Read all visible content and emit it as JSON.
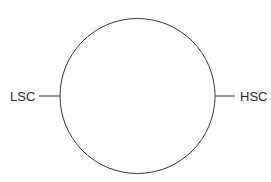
{
  "diagram": {
    "labels": {
      "left": "LSC",
      "right": "HSC"
    },
    "colors": {
      "stroke": "#333333",
      "background": "#ffffff"
    }
  }
}
